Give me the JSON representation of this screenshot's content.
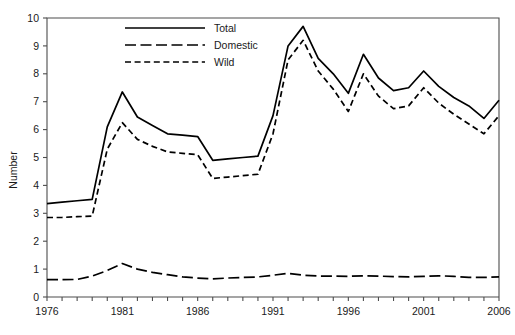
{
  "chart_data": {
    "type": "line",
    "title": "",
    "subtitle": "",
    "xlabel": "",
    "ylabel": "Number",
    "xlim": [
      1976,
      2006
    ],
    "ylim": [
      0,
      10
    ],
    "grid": false,
    "legend_position": "top-center",
    "y_ticks": [
      0,
      1,
      2,
      3,
      4,
      5,
      6,
      7,
      8,
      9,
      10
    ],
    "y_tick_labels": [
      "0",
      "1",
      "2",
      "3",
      "4",
      "5",
      "6",
      "7",
      "8",
      "9",
      "10"
    ],
    "x_ticks": [
      1976,
      1977,
      1978,
      1979,
      1980,
      1981,
      1982,
      1983,
      1984,
      1985,
      1986,
      1987,
      1988,
      1989,
      1990,
      1991,
      1992,
      1993,
      1994,
      1995,
      1996,
      1997,
      1998,
      1999,
      2000,
      2001,
      2002,
      2003,
      2004,
      2005,
      2006
    ],
    "x_tick_labels": [
      "1976",
      "",
      "",
      "",
      "",
      "1981",
      "",
      "",
      "",
      "",
      "1986",
      "",
      "",
      "",
      "",
      "1991",
      "",
      "",
      "",
      "",
      "1996",
      "",
      "",
      "",
      "",
      "2001",
      "",
      "",
      "",
      "",
      "2006"
    ],
    "x": [
      1976,
      1977,
      1978,
      1979,
      1980,
      1981,
      1982,
      1983,
      1984,
      1985,
      1986,
      1987,
      1988,
      1989,
      1990,
      1991,
      1992,
      1993,
      1994,
      1995,
      1996,
      1997,
      1998,
      1999,
      2000,
      2001,
      2002,
      2003,
      2004,
      2005,
      2006
    ],
    "series": [
      {
        "name": "Total",
        "style": "solid",
        "color": "#000000",
        "values": [
          3.35,
          3.4,
          3.45,
          3.5,
          6.1,
          7.35,
          6.45,
          6.15,
          5.85,
          5.8,
          5.75,
          4.9,
          4.95,
          5.0,
          5.05,
          6.5,
          9.0,
          9.7,
          8.55,
          8.0,
          7.3,
          8.7,
          7.85,
          7.4,
          7.5,
          8.1,
          7.55,
          7.15,
          6.85,
          6.4,
          7.05
        ]
      },
      {
        "name": "Domestic",
        "style": "longdash",
        "color": "#000000",
        "values": [
          0.62,
          0.62,
          0.63,
          0.75,
          0.95,
          1.2,
          1.0,
          0.88,
          0.8,
          0.72,
          0.68,
          0.65,
          0.68,
          0.7,
          0.72,
          0.78,
          0.85,
          0.78,
          0.75,
          0.75,
          0.74,
          0.76,
          0.75,
          0.73,
          0.72,
          0.74,
          0.76,
          0.74,
          0.7,
          0.7,
          0.72
        ]
      },
      {
        "name": "Wild",
        "style": "dash",
        "color": "#000000",
        "values": [
          2.85,
          2.85,
          2.88,
          2.9,
          5.3,
          6.25,
          5.65,
          5.4,
          5.2,
          5.15,
          5.1,
          4.25,
          4.3,
          4.35,
          4.4,
          5.85,
          8.5,
          9.2,
          8.1,
          7.45,
          6.65,
          8.0,
          7.2,
          6.75,
          6.85,
          7.5,
          6.95,
          6.55,
          6.2,
          5.85,
          6.5
        ]
      }
    ]
  },
  "legend": {
    "items": [
      {
        "label": "Total",
        "style": "solid"
      },
      {
        "label": "Domestic",
        "style": "longdash"
      },
      {
        "label": "Wild",
        "style": "dash"
      }
    ]
  },
  "axes": {
    "y_title": "Number"
  }
}
